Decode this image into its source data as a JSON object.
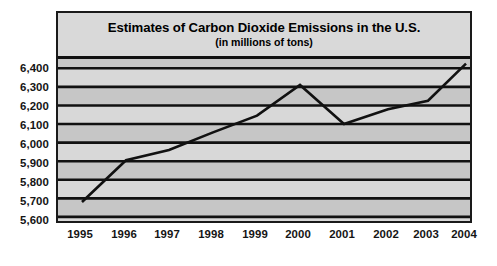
{
  "chart_data": {
    "type": "line",
    "title": "Estimates of Carbon Dioxide Emissions in the U.S.",
    "subtitle": "(in millions of tons)",
    "xlabel": "",
    "ylabel": "",
    "categories": [
      "1995",
      "1996",
      "1997",
      "1998",
      "1999",
      "2000",
      "2001",
      "2002",
      "2003",
      "2004"
    ],
    "x": [
      1995,
      1996,
      1997,
      1998,
      1999,
      2000,
      2001,
      2002,
      2003,
      2004
    ],
    "values": [
      5680,
      5905,
      5960,
      6055,
      6145,
      6310,
      6100,
      6180,
      6225,
      6425
    ],
    "series": [
      {
        "name": "Carbon dioxide emissions",
        "values": [
          5680,
          5905,
          5960,
          6055,
          6145,
          6310,
          6100,
          6180,
          6225,
          6425
        ]
      }
    ],
    "ylim": [
      5600,
      6450
    ],
    "ytick_labels": [
      "6,400",
      "6,300",
      "6,200",
      "6,100",
      "6,000",
      "5,900",
      "5,800",
      "5,700",
      "5,600"
    ],
    "ytick_values": [
      6400,
      6300,
      6200,
      6100,
      6000,
      5900,
      5800,
      5700,
      5600
    ],
    "grid": true,
    "legend": "none",
    "colors": {
      "line": "#111111",
      "grid": "#111111",
      "band_light": "#d8d8d8",
      "band_dark": "#c6c6c6",
      "border": "#1a1a1a",
      "text": "#151515"
    }
  }
}
